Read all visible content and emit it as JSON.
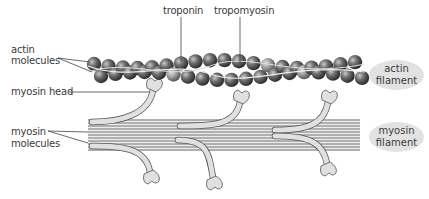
{
  "diagram": {
    "labels": {
      "troponin": "troponin",
      "tropomyosin": "tropomyosin",
      "actin_molecules_line1": "actin",
      "actin_molecules_line2": "molecules",
      "myosin_head": "myosin head",
      "myosin_molecules_line1": "myosin",
      "myosin_molecules_line2": "molecules"
    },
    "legend": {
      "actin_filament_line1": "actin",
      "actin_filament_line2": "filament",
      "myosin_filament_line1": "myosin",
      "myosin_filament_line2": "filament"
    },
    "colors": {
      "actin_bead": "#6b6b6b",
      "troponin_bead": "#9a9a9a",
      "myosin_fill": "#e0e0e0",
      "myosin_stroke": "#555555",
      "legend_fill": "#e2e2e2",
      "leader_line": "#444444"
    }
  }
}
